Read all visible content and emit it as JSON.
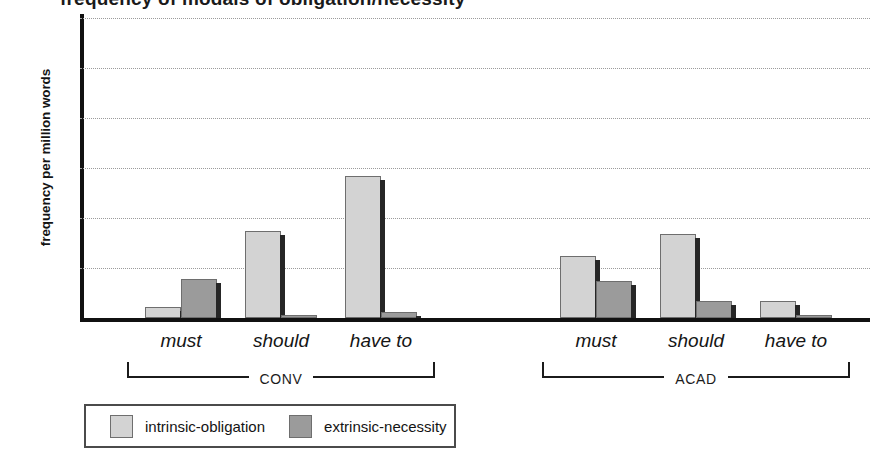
{
  "chart_data": {
    "type": "bar",
    "title": "frequency of modals of obligation/necessity",
    "ylabel": "frequency per million words",
    "xlabel": "",
    "ylim": [
      0,
      3000
    ],
    "yticks": [
      0,
      500,
      1000,
      1500,
      2000,
      2500,
      3000
    ],
    "grid": true,
    "legend_position": "bottom-left",
    "categories": [
      "must",
      "should",
      "have to",
      "must",
      "should",
      "have to"
    ],
    "groups": [
      {
        "name": "CONV",
        "categories": [
          "must",
          "should",
          "have to"
        ]
      },
      {
        "name": "ACAD",
        "categories": [
          "must",
          "should",
          "have to"
        ]
      }
    ],
    "series": [
      {
        "name": "intrinsic-obligation",
        "color": "#d3d3d3",
        "values": [
          110,
          870,
          1420,
          620,
          840,
          170
        ]
      },
      {
        "name": "extrinsic-necessity",
        "color": "#9b9b9b",
        "values": [
          390,
          30,
          60,
          370,
          170,
          35
        ]
      }
    ]
  },
  "legend": {
    "items": [
      {
        "label": "intrinsic-obligation",
        "swatch": "intrinsic"
      },
      {
        "label": "extrinsic-necessity",
        "swatch": "extrinsic"
      }
    ]
  }
}
